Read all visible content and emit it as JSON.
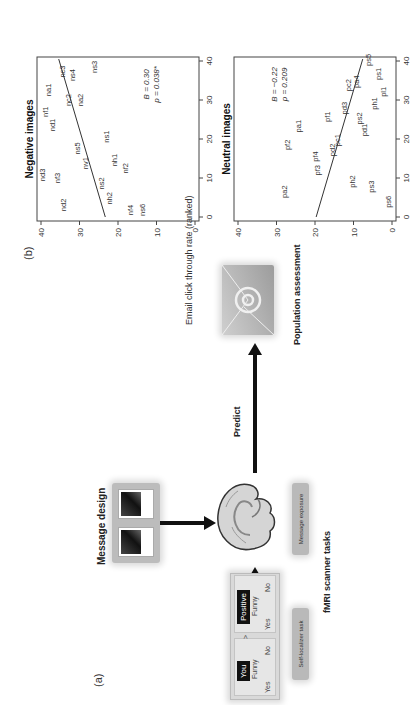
{
  "figure": {
    "panel_a": {
      "label": "(a)",
      "message_design_title": "Message design",
      "predict_label": "Predict",
      "population_label": "Population assessment",
      "fmri_label": "fMRI scanner tasks",
      "self_localizer_label": "Self-localizer task",
      "message_exposure_label": "Message exposure",
      "task_cards": [
        {
          "tag": "You",
          "word": "Funny",
          "yes": "Yes",
          "no": "No"
        },
        {
          "tag": "Positive",
          "word": "Funny",
          "yes": "Yes",
          "no": "No"
        }
      ],
      "card_separator": ">",
      "icons": {
        "brain": "brain-icon",
        "email": "email-at-icon"
      }
    },
    "panel_b": {
      "label": "(b)",
      "shared_ylabel": "Email click through rate (ranked)"
    }
  },
  "chart_data": [
    {
      "type": "scatter",
      "title": "Negative images",
      "xlabel": "",
      "ylabel": "Email click through rate (ranked)",
      "xlim": [
        0,
        40
      ],
      "ylim": [
        0,
        40
      ],
      "xticks": [
        "0",
        "10",
        "20",
        "30",
        "40"
      ],
      "yticks": [
        "0",
        "10",
        "20",
        "30",
        "40"
      ],
      "annotation": [
        "B = 0.30",
        "p = 0.038*"
      ],
      "fit_line": {
        "x": [
          0,
          40.5
        ],
        "y": [
          23.3,
          35.4
        ]
      },
      "points": [
        {
          "label": "nd3",
          "x": 10.8,
          "y": 39.8
        },
        {
          "label": "nf3",
          "x": 10.0,
          "y": 35.9
        },
        {
          "label": "nd2",
          "x": 3.1,
          "y": 34.3
        },
        {
          "label": "nd1",
          "x": 23.6,
          "y": 37.2
        },
        {
          "label": "nf1",
          "x": 27.0,
          "y": 39.0
        },
        {
          "label": "na1",
          "x": 32.6,
          "y": 38.1
        },
        {
          "label": "nc3",
          "x": 37.3,
          "y": 34.6
        },
        {
          "label": "nc2",
          "x": 30.0,
          "y": 33.1
        },
        {
          "label": "ns4",
          "x": 36.4,
          "y": 32.0
        },
        {
          "label": "na2",
          "x": 30.0,
          "y": 30.0
        },
        {
          "label": "ns3",
          "x": 38.5,
          "y": 26.2
        },
        {
          "label": "ns5",
          "x": 17.6,
          "y": 30.7
        },
        {
          "label": "nv1",
          "x": 13.8,
          "y": 28.7
        },
        {
          "label": "ns1",
          "x": 20.6,
          "y": 23.1
        },
        {
          "label": "nh1",
          "x": 14.6,
          "y": 21.0
        },
        {
          "label": "nf2",
          "x": 12.5,
          "y": 18.2
        },
        {
          "label": "ns2",
          "x": 8.6,
          "y": 24.5
        },
        {
          "label": "nh2",
          "x": 4.8,
          "y": 22.3
        },
        {
          "label": "nf4",
          "x": 1.8,
          "y": 16.9
        },
        {
          "label": "ns6",
          "x": 1.8,
          "y": 13.8
        }
      ]
    },
    {
      "type": "scatter",
      "title": "Neutral images",
      "xlabel": "",
      "ylabel": "Email click through rate (ranked)",
      "xlim": [
        0,
        40
      ],
      "ylim": [
        0,
        40
      ],
      "xticks": [
        "0",
        "10",
        "20",
        "30",
        "40"
      ],
      "yticks": [
        "0",
        "10",
        "20",
        "30",
        "40"
      ],
      "annotation": [
        "B = −0.22",
        "p = 0.209"
      ],
      "fit_line": {
        "x": [
          0,
          40.5
        ],
        "y": [
          19.7,
          7.6
        ]
      },
      "points": [
        {
          "label": "pa2",
          "x": 6.5,
          "y": 28.1
        },
        {
          "label": "pf2",
          "x": 18.5,
          "y": 27.2
        },
        {
          "label": "pa1",
          "x": 23.3,
          "y": 24.5
        },
        {
          "label": "pf4",
          "x": 15.5,
          "y": 20.0
        },
        {
          "label": "pf3",
          "x": 12.0,
          "y": 19.6
        },
        {
          "label": "pf1",
          "x": 25.7,
          "y": 16.8
        },
        {
          "label": "pd2",
          "x": 17.2,
          "y": 15.5
        },
        {
          "label": "pc1",
          "x": 19.7,
          "y": 14.2
        },
        {
          "label": "pd3",
          "x": 27.9,
          "y": 12.5
        },
        {
          "label": "pc2",
          "x": 33.8,
          "y": 11.3
        },
        {
          "label": "pa4",
          "x": 34.7,
          "y": 9.4
        },
        {
          "label": "ps2",
          "x": 25.3,
          "y": 8.5
        },
        {
          "label": "pd1",
          "x": 22.3,
          "y": 7.2
        },
        {
          "label": "ph2",
          "x": 9.1,
          "y": 10.3
        },
        {
          "label": "ps3",
          "x": 7.8,
          "y": 5.5
        },
        {
          "label": "ps6",
          "x": 3.9,
          "y": 1.1
        },
        {
          "label": "ph1",
          "x": 29.1,
          "y": 4.6
        },
        {
          "label": "pl1",
          "x": 32.1,
          "y": 2.4
        },
        {
          "label": "ps1",
          "x": 36.7,
          "y": 3.7
        },
        {
          "label": "ps5",
          "x": 40.3,
          "y": 6.3
        }
      ]
    }
  ]
}
